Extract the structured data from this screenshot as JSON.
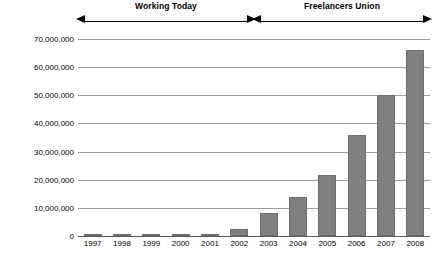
{
  "chart_data": {
    "type": "bar",
    "title": "",
    "xlabel": "",
    "ylabel": "Revenue ($)",
    "categories": [
      "1997",
      "1998",
      "1999",
      "2000",
      "2001",
      "2002",
      "2003",
      "2004",
      "2005",
      "2006",
      "2007",
      "2008"
    ],
    "values": [
      200000,
      250000,
      300000,
      350000,
      500000,
      2500000,
      8200000,
      13700000,
      21700000,
      36000000,
      50000000,
      66000000
    ],
    "ylim": [
      0,
      70000000
    ],
    "ytick_values": [
      0,
      10000000,
      20000000,
      30000000,
      40000000,
      50000000,
      60000000,
      70000000
    ],
    "ytick_labels": [
      "0",
      "10,000,000",
      "20,000,000",
      "30,000,000",
      "40,000,000",
      "50,000,000",
      "60,000,000",
      "70,000,000"
    ],
    "grid": true,
    "legend": "none",
    "bar_color": "#808080",
    "annotations": [
      {
        "label": "Working Today",
        "start_category": "1997",
        "end_category": "2002",
        "style": "double-headed-arrow"
      },
      {
        "label": "Freelancers Union",
        "start_category": "2003",
        "end_category": "2008",
        "style": "double-headed-arrow"
      }
    ]
  }
}
